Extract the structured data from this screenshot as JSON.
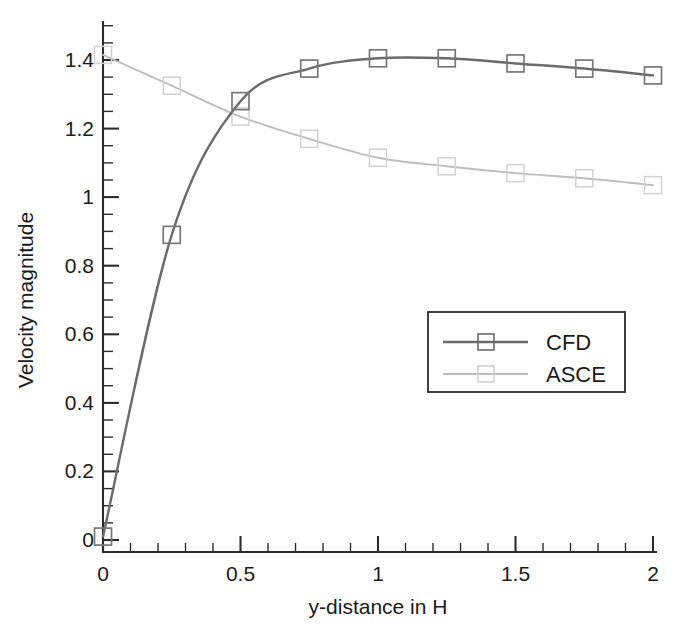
{
  "chart_data": {
    "type": "line",
    "title": "",
    "xlabel": "y-distance in H",
    "ylabel": "Velocity magnitude",
    "xlim": [
      0,
      2
    ],
    "ylim": [
      0,
      1.46
    ],
    "grid": false,
    "legend_position": "center-right",
    "xticks": [
      0,
      0.5,
      1,
      1.5,
      2
    ],
    "xtick_labels": [
      "0",
      "0.5",
      "1",
      "1.5",
      "2"
    ],
    "x_minor_step": 0.1,
    "yticks": [
      0,
      0.2,
      0.4,
      0.6,
      0.8,
      1,
      1.2,
      1.4
    ],
    "ytick_labels": [
      "0",
      "0.2",
      "0.4",
      "0.6",
      "0.8",
      "1",
      "1.2",
      "1.4"
    ],
    "y_minor_step": 0.05,
    "marker": "square-open",
    "series": [
      {
        "name": "CFD",
        "color": "#6b6b6b",
        "x": [
          0,
          0.25,
          0.5,
          0.75,
          1.0,
          1.25,
          1.5,
          1.75,
          2.0
        ],
        "values": [
          0.01,
          0.89,
          1.28,
          1.375,
          1.405,
          1.405,
          1.39,
          1.375,
          1.355
        ]
      },
      {
        "name": "ASCE",
        "color": "#bdbdbd",
        "x": [
          0,
          0.25,
          0.5,
          0.75,
          1.0,
          1.25,
          1.5,
          1.75,
          2.0
        ],
        "values": [
          1.415,
          1.325,
          1.235,
          1.17,
          1.115,
          1.09,
          1.07,
          1.055,
          1.035
        ]
      }
    ]
  },
  "legend": {
    "entries": [
      {
        "label": "CFD"
      },
      {
        "label": "ASCE"
      }
    ]
  },
  "axes": {
    "x_title": "y-distance in H",
    "y_title": "Velocity magnitude"
  }
}
